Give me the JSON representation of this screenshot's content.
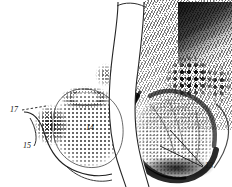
{
  "figure": {
    "panels": [
      {
        "id": "left-panel",
        "kind": "stipple-line-drawing",
        "description": "Stippled diagrammatic half showing an oval tissue mass with a dense granular rim"
      },
      {
        "id": "right-panel",
        "kind": "photomicrograph",
        "description": "Halftone photomicrograph half showing a dark-rimmed pale tissue mass beneath mottled dark structures"
      }
    ],
    "divider": {
      "name": "central-white-channel",
      "shape": "vase"
    },
    "background_color": "#ffffff",
    "ink_color": "#131313"
  },
  "labels": [
    {
      "id": "13",
      "text": "13",
      "panel": "right-panel",
      "leaders": 2
    },
    {
      "id": "14",
      "text": "14",
      "panel": "left-panel",
      "leaders": 0
    },
    {
      "id": "15",
      "text": "15",
      "panel": "left-panel",
      "leaders": 1
    },
    {
      "id": "17",
      "text": "17",
      "panel": "left-panel",
      "leaders": 1
    }
  ]
}
